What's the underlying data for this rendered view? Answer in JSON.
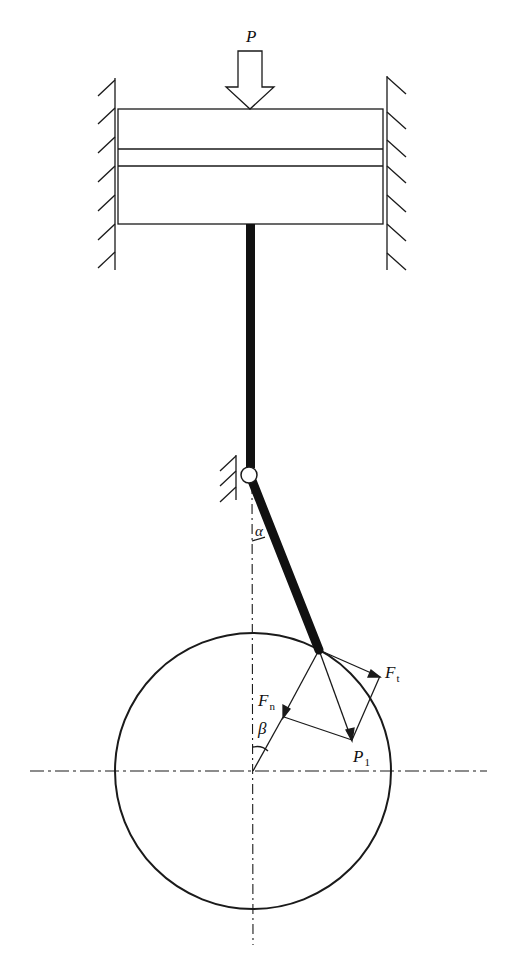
{
  "diagram": {
    "type": "mechanism",
    "labels": {
      "force_P": "P",
      "angle_alpha": "α",
      "force_Fn": "F",
      "force_Fn_sub": "n",
      "force_Ft": "F",
      "force_Ft_sub": "t",
      "force_P1": "P",
      "force_P1_sub": "1",
      "angle_beta": "β"
    },
    "colors": {
      "stroke": "#1a1a1a",
      "background": "#ffffff"
    }
  }
}
